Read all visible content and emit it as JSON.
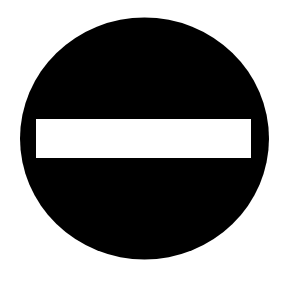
{
  "sign": {
    "name": "No entry sign",
    "circle_color": "#000000",
    "bar_color": "#ffffff",
    "background_color": "#ffffff"
  }
}
